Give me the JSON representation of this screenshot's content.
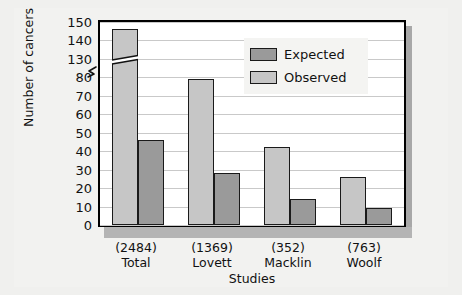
{
  "chart_data": {
    "type": "bar",
    "title": "",
    "xlabel": "Studies",
    "ylabel": "Number of cancers",
    "categories": [
      "Total",
      "Lovett",
      "Macklin",
      "Woolf"
    ],
    "category_counts": [
      "(2484)",
      "(1369)",
      "(352)",
      "(763)"
    ],
    "series": [
      {
        "name": "Observed",
        "color": "#c6c6c6",
        "values": [
          146,
          79,
          42,
          26
        ]
      },
      {
        "name": "Expected",
        "color": "#9a9a9a",
        "values": [
          46,
          28,
          14,
          9
        ]
      }
    ],
    "yticks": [
      0,
      10,
      20,
      30,
      40,
      50,
      60,
      70,
      80,
      130,
      140,
      150
    ],
    "ylim": [
      0,
      150
    ],
    "axis_break": {
      "present": true,
      "from": 80,
      "to": 130
    },
    "grid": true,
    "legend_position": "upper-right",
    "legend_entries": [
      "Expected",
      "Observed"
    ]
  },
  "axes": {
    "y_title": "Number of cancers",
    "x_title": "Studies"
  },
  "legend": {
    "expected_label": "Expected",
    "observed_label": "Observed"
  },
  "colors": {
    "observed": "#c6c6c6",
    "expected": "#9a9a9a",
    "frame": "#000000",
    "gridline": "#c9c9c9",
    "background": "#f0f0ee",
    "baseline_band": "#b4b4b4"
  }
}
